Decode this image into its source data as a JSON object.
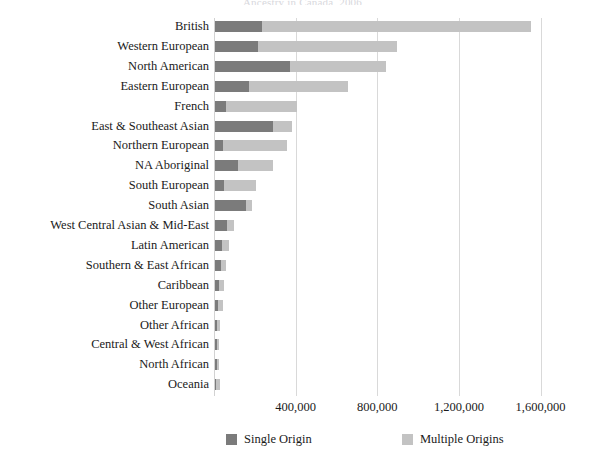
{
  "title_cropped": "Ancestry in Canada, 2006",
  "chart_data": {
    "type": "bar",
    "orientation": "horizontal",
    "stacked": true,
    "title": "",
    "xlabel": "",
    "ylabel": "",
    "xlim": [
      0,
      1700000
    ],
    "grid": true,
    "legend_position": "bottom",
    "xticks": [
      "400,000",
      "800,000",
      "1,200,000",
      "1,600,000"
    ],
    "xtick_values": [
      400000,
      800000,
      1200000,
      1600000
    ],
    "categories": [
      "British",
      "Western European",
      "North American",
      "Eastern European",
      "French",
      "East & Southeast Asian",
      "Northern European",
      "NA Aboriginal",
      "South European",
      "South Asian",
      "West Central Asian & Mid-East",
      "Latin American",
      "Southern & East African",
      "Caribbean",
      "Other European",
      "Other African",
      "Central & West African",
      "North African",
      "Oceania"
    ],
    "series": [
      {
        "name": "Single Origin",
        "color": "#7b7b7b",
        "values": [
          231000,
          212000,
          365000,
          166000,
          55000,
          286000,
          37000,
          111000,
          46000,
          152000,
          60000,
          35000,
          28000,
          22000,
          14000,
          12000,
          10000,
          9000,
          6000
        ]
      },
      {
        "name": "Multiple Origins",
        "color": "#c3c3c3",
        "values": [
          1316000,
          679000,
          471000,
          485000,
          347000,
          93000,
          314000,
          171000,
          153000,
          28000,
          32000,
          34000,
          27000,
          24000,
          23000,
          13000,
          12000,
          11000,
          19000
        ]
      }
    ],
    "totals": [
      1547000,
      891000,
      836000,
      651000,
      402000,
      379000,
      351000,
      282000,
      199000,
      180000,
      92000,
      69000,
      55000,
      46000,
      37000,
      25000,
      22000,
      20000,
      25000
    ]
  },
  "legend": {
    "items": [
      {
        "label": "Single Origin",
        "color": "#7b7b7b"
      },
      {
        "label": "Multiple Origins",
        "color": "#c3c3c3"
      }
    ]
  }
}
